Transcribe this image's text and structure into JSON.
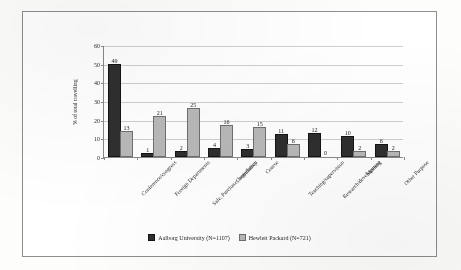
{
  "chart_data": {
    "type": "bar",
    "title": "",
    "subtitle": "",
    "xlabel": "",
    "ylabel": "% of total travelling",
    "ylim": [
      0,
      60
    ],
    "ytick_step": 10,
    "yticks": [
      0,
      10,
      20,
      30,
      40,
      50,
      60
    ],
    "grid": true,
    "legend_position": "bottom-center",
    "categories": [
      "Conference/congress",
      "Foreign Departments",
      "Sale, Purchase, negotiation",
      "Consultancy",
      "Course",
      "Teaching/supervision",
      "Research/development",
      "Meeting",
      "Other Purpose"
    ],
    "series": [
      {
        "name": "Aalborg University (N=1107)",
        "color": "#2f2f2f",
        "values": [
          49,
          1,
          2,
          4,
          3,
          11,
          12,
          10,
          6
        ]
      },
      {
        "name": "Hewlett Packard (N=721)",
        "color": "#b9b9b9",
        "values": [
          13,
          21,
          25,
          16,
          15,
          6,
          0,
          2,
          2
        ]
      }
    ]
  },
  "legend": {
    "items": [
      {
        "label": "Aalborg University (N=1107)"
      },
      {
        "label": "Hewlett Packard (N=721)"
      }
    ]
  }
}
